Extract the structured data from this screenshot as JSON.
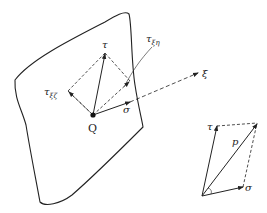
{
  "diagram": {
    "title": "",
    "main": {
      "point": "Q",
      "tau": "τ",
      "tau_xi_zeta": {
        "base": "τ",
        "sub": "ξζ"
      },
      "tau_xi_eta": {
        "base": "τ",
        "sub": "ξη"
      },
      "sigma": "σ",
      "xi_axis": "ξ"
    },
    "inset": {
      "tau": "τ",
      "p": "p",
      "sigma": "σ"
    },
    "colors": {
      "line": "#222222",
      "background": "#ffffff"
    }
  }
}
